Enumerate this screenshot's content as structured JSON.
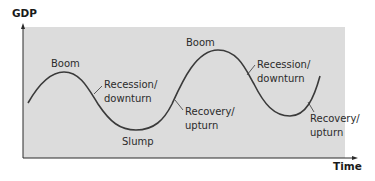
{
  "diagram": {
    "axes": {
      "y_label": "GDP",
      "x_label": "Time"
    },
    "colors": {
      "panel": "#dcdcdc",
      "curve": "#3a3a3a",
      "axis": "#2a2a2a",
      "text": "#2b2b2b"
    },
    "labels": [
      {
        "id": "boom-1",
        "lines": [
          "Boom"
        ]
      },
      {
        "id": "recession-1",
        "lines": [
          "Recession/",
          "downturn"
        ]
      },
      {
        "id": "slump",
        "lines": [
          "Slump"
        ]
      },
      {
        "id": "boom-2",
        "lines": [
          "Boom"
        ]
      },
      {
        "id": "recovery-1",
        "lines": [
          "Recovery/",
          "upturn"
        ]
      },
      {
        "id": "recession-2",
        "lines": [
          "Recession/",
          "downturn"
        ]
      },
      {
        "id": "recovery-2",
        "lines": [
          "Recovery/",
          "upturn"
        ]
      }
    ]
  }
}
